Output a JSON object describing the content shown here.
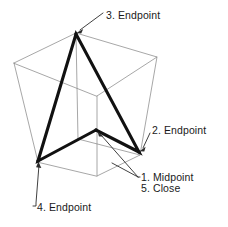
{
  "figure": {
    "background_color": "#ffffff",
    "wireframe_color": "#8a8a8a",
    "polyline_color": "#111111",
    "leader_color": "#2b2b2b",
    "text_color": "#1a1a1a"
  },
  "labels": {
    "endpoint_3": "3. Endpoint",
    "endpoint_2": "2. Endpoint",
    "midpoint_1": "1. Midpoint",
    "close_5": "5. Close",
    "endpoint_4": "4. Endpoint"
  },
  "geometry": {
    "box_top_face": [
      [
        14,
        63
      ],
      [
        76,
        33
      ],
      [
        157,
        57
      ],
      [
        97,
        96
      ]
    ],
    "box_bottom_face": [
      [
        38,
        162
      ],
      [
        78,
        139
      ],
      [
        140,
        155
      ],
      [
        97,
        176
      ]
    ],
    "polyline_points": [
      [
        96,
        130
      ],
      [
        38,
        161
      ],
      [
        76,
        34
      ],
      [
        139,
        152
      ],
      [
        96,
        130
      ]
    ],
    "vertex_markers": [
      {
        "name": "midpoint-1",
        "x": 96,
        "y": 130
      },
      {
        "name": "endpoint-2",
        "x": 139,
        "y": 152
      },
      {
        "name": "endpoint-3",
        "x": 76,
        "y": 34
      },
      {
        "name": "endpoint-4",
        "x": 38,
        "y": 161
      }
    ]
  },
  "leaders": [
    {
      "name": "leader-endpoint-3",
      "from": [
        103,
        13
      ],
      "to": [
        78,
        32
      ]
    },
    {
      "name": "leader-endpoint-2",
      "from": [
        150,
        133
      ],
      "to": [
        141,
        150
      ]
    },
    {
      "name": "leader-midpoint-1",
      "from": [
        138,
        177
      ],
      "to": [
        99,
        133
      ]
    },
    {
      "name": "leader-close-5",
      "from": [
        138,
        177
      ],
      "to": [
        115,
        166
      ]
    },
    {
      "name": "leader-endpoint-4",
      "from": [
        33,
        206
      ],
      "to": [
        39,
        163
      ]
    }
  ]
}
